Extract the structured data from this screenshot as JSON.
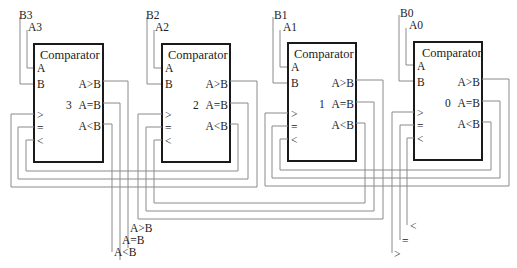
{
  "diagram": {
    "block_title": "Comparator",
    "port_labels": {
      "in_a": "A",
      "in_b": "B",
      "in_gt": ">",
      "in_eq": "=",
      "in_lt": "<",
      "out_gt": "A>B",
      "out_eq": "A=B",
      "out_lt": "A<B"
    },
    "blocks": [
      {
        "index": "3",
        "a_label": "A3",
        "b_label": "B3"
      },
      {
        "index": "2",
        "a_label": "A2",
        "b_label": "B2"
      },
      {
        "index": "1",
        "a_label": "A1",
        "b_label": "B1"
      },
      {
        "index": "0",
        "a_label": "A0",
        "b_label": "B0"
      }
    ],
    "final_outputs": {
      "gt": "A>B",
      "eq": "A=B",
      "lt": "A<B"
    },
    "cascade_inputs": {
      "lt": "<",
      "eq": "=",
      "gt": ">"
    }
  }
}
